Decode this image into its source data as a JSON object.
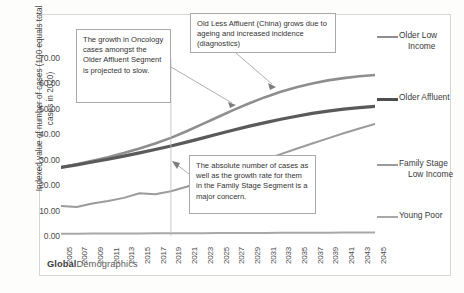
{
  "chart_data": {
    "type": "line",
    "title": "",
    "xlabel": "",
    "ylabel": "Indexed value of number of cases (100 equals total cases in 2020)",
    "ylim": [
      0,
      70
    ],
    "yticks": [
      "0.00",
      "10.00",
      "20.00",
      "30.00",
      "40.00",
      "50.00",
      "60.00",
      "70.00"
    ],
    "grid": false,
    "legend_position": "right",
    "x": [
      2005,
      2007,
      2009,
      2011,
      2013,
      2015,
      2017,
      2019,
      2021,
      2023,
      2025,
      2027,
      2029,
      2031,
      2033,
      2035,
      2037,
      2039,
      2041,
      2043,
      2045
    ],
    "xticks": [
      "2005",
      "2007",
      "2009",
      "2011",
      "2013",
      "2015",
      "2017",
      "2019",
      "2021",
      "2023",
      "2025",
      "2027",
      "2029",
      "2031",
      "2033",
      "2035",
      "2037",
      "2039",
      "2041",
      "2043",
      "2045"
    ],
    "series": [
      {
        "name": "Older Low Income",
        "color": "#8e8e8e",
        "values": [
          27.0,
          28.2,
          29.6,
          31.0,
          32.6,
          34.4,
          36.4,
          38.6,
          41.2,
          44.0,
          46.8,
          49.6,
          52.2,
          54.6,
          56.7,
          58.5,
          60.0,
          61.2,
          62.1,
          62.8,
          63.3
        ]
      },
      {
        "name": "Older Affluent",
        "color": "#5a5a5a",
        "values": [
          27.0,
          28.0,
          29.1,
          30.2,
          31.4,
          32.7,
          34.0,
          35.4,
          36.9,
          38.5,
          40.1,
          41.7,
          43.2,
          44.6,
          45.9,
          47.1,
          48.2,
          49.1,
          49.9,
          50.5,
          51.0
        ]
      },
      {
        "name": "Family Stage Low Income",
        "color": "#9b9b9b",
        "values": [
          11.8,
          11.4,
          12.8,
          13.8,
          15.0,
          16.8,
          16.4,
          17.6,
          19.4,
          21.3,
          23.4,
          25.6,
          27.8,
          30.0,
          32.2,
          34.3,
          36.4,
          38.4,
          40.4,
          42.3,
          44.1
        ]
      },
      {
        "name": "Young Poor",
        "color": "#a8a8a8",
        "values": [
          0.9,
          0.9,
          0.95,
          0.95,
          1.0,
          1.0,
          1.05,
          1.05,
          1.1,
          1.1,
          1.15,
          1.15,
          1.2,
          1.2,
          1.25,
          1.25,
          1.3,
          1.3,
          1.35,
          1.35,
          1.4
        ]
      }
    ],
    "annotations": [
      {
        "id": "oncology",
        "text": "The growth in Oncology cases amongst the Older Affluent Segment is projected to slow.",
        "points_to": "Older Affluent"
      },
      {
        "id": "china",
        "text": "Old Less Affluent (China) grows due to ageing and increased incidence (diagnostics)",
        "points_to": "Older Low Income"
      },
      {
        "id": "family",
        "text": "The absolute number of cases as well as the growth rate for them in the Family Stage Segment is a major concern.",
        "points_to": "Family Stage Low Income"
      }
    ],
    "divider_year": 2019
  },
  "legend": {
    "items": [
      {
        "label_line1": "Older Low",
        "label_line2": "Income",
        "color": "#8e8e8e",
        "width": 2.6
      },
      {
        "label_line1": "Older Affluent",
        "label_line2": "",
        "color": "#4f4f4f",
        "width": 3.2
      },
      {
        "label_line1": "Family Stage",
        "label_line2": "Low Income",
        "color": "#9b9b9b",
        "width": 2.0
      },
      {
        "label_line1": "Young Poor",
        "label_line2": "",
        "color": "#a8a8a8",
        "width": 2.0
      }
    ]
  },
  "brand": {
    "bold": "Global",
    "rest": "Demographics"
  }
}
